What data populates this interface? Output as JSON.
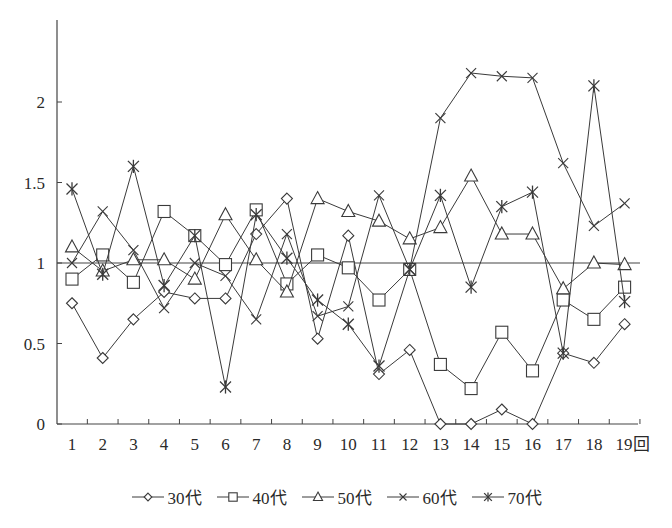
{
  "chart_data": {
    "type": "line",
    "title": "",
    "xlabel": "回",
    "ylabel": "",
    "x": [
      1,
      2,
      3,
      4,
      5,
      6,
      7,
      8,
      9,
      10,
      11,
      12,
      13,
      14,
      15,
      16,
      17,
      18,
      19
    ],
    "x_tick_labels": [
      "1",
      "2",
      "3",
      "4",
      "5",
      "6",
      "7",
      "8",
      "9",
      "10",
      "11",
      "12",
      "13",
      "14",
      "15",
      "16",
      "17",
      "18",
      "19回"
    ],
    "y_ticks": [
      0,
      0.5,
      1,
      1.5,
      2
    ],
    "y_tick_labels": [
      "0",
      "0.5",
      "1",
      "1.5",
      "2"
    ],
    "ylim": [
      0,
      2.5
    ],
    "reference_line": 1,
    "grid": false,
    "legend_position": "bottom",
    "series": [
      {
        "name": "30代",
        "marker": "diamond",
        "values": [
          0.75,
          0.41,
          0.65,
          0.82,
          0.78,
          0.78,
          1.18,
          1.4,
          0.53,
          1.17,
          0.31,
          0.46,
          0.0,
          0.0,
          0.09,
          0.0,
          0.44,
          0.38,
          0.62
        ]
      },
      {
        "name": "40代",
        "marker": "square",
        "values": [
          0.9,
          1.05,
          0.88,
          1.32,
          1.17,
          0.99,
          1.33,
          0.87,
          1.05,
          0.97,
          0.77,
          0.96,
          0.37,
          0.22,
          0.57,
          0.33,
          0.77,
          0.65,
          0.85
        ]
      },
      {
        "name": "50代",
        "marker": "triangle",
        "values": [
          1.1,
          0.95,
          1.02,
          1.02,
          0.9,
          1.3,
          1.02,
          0.82,
          1.4,
          1.32,
          1.26,
          1.15,
          1.22,
          1.54,
          1.18,
          1.18,
          0.84,
          1.0,
          0.99
        ]
      },
      {
        "name": "60代",
        "marker": "x",
        "values": [
          1.0,
          1.32,
          1.08,
          0.72,
          1.0,
          0.92,
          0.65,
          1.18,
          0.67,
          0.73,
          1.42,
          0.96,
          1.9,
          2.18,
          2.16,
          2.15,
          1.62,
          1.23,
          1.37
        ]
      },
      {
        "name": "70代",
        "marker": "asterisk",
        "values": [
          1.46,
          0.93,
          1.6,
          0.86,
          1.17,
          0.23,
          1.3,
          1.03,
          0.77,
          0.62,
          0.36,
          0.96,
          1.42,
          0.85,
          1.35,
          1.44,
          0.44,
          2.1,
          0.76
        ]
      }
    ]
  },
  "legend": {
    "items": [
      {
        "label": "30代",
        "marker": "diamond"
      },
      {
        "label": "40代",
        "marker": "square"
      },
      {
        "label": "50代",
        "marker": "triangle"
      },
      {
        "label": "60代",
        "marker": "x"
      },
      {
        "label": "70代",
        "marker": "asterisk"
      }
    ]
  },
  "colors": {
    "line": "#3a3a3a",
    "axis": "#444444",
    "background": "#ffffff"
  }
}
